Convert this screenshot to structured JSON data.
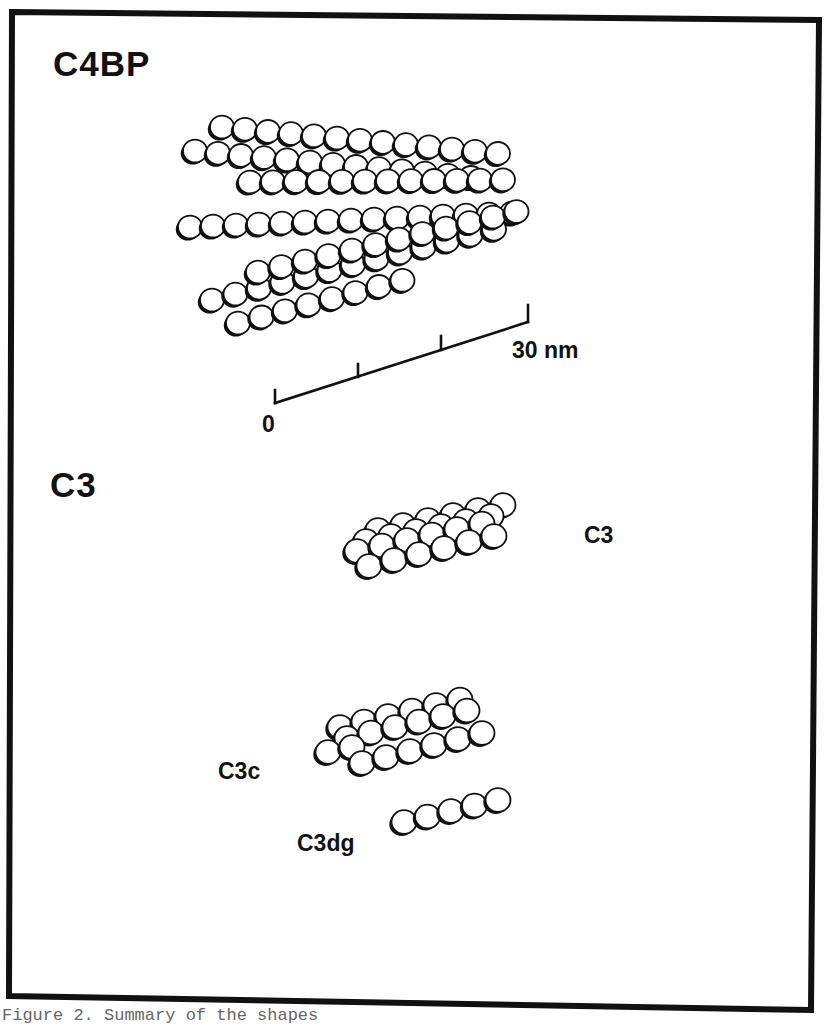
{
  "figure": {
    "frame_color": "#111111",
    "sphere_fill": "#ffffff",
    "sphere_stroke": "#111111",
    "caption_partial": "Figure 2. Summary of the shapes"
  },
  "panels": [
    {
      "id": "c4bp",
      "title": "C4BP"
    },
    {
      "id": "c3",
      "title": "C3"
    }
  ],
  "scale_bar": {
    "start_label": "0",
    "end_label": "30 nm",
    "ticks": 4
  },
  "molecules": {
    "c3": {
      "label": "C3"
    },
    "c3c": {
      "label": "C3c"
    },
    "c3dg": {
      "label": "C3dg"
    }
  }
}
